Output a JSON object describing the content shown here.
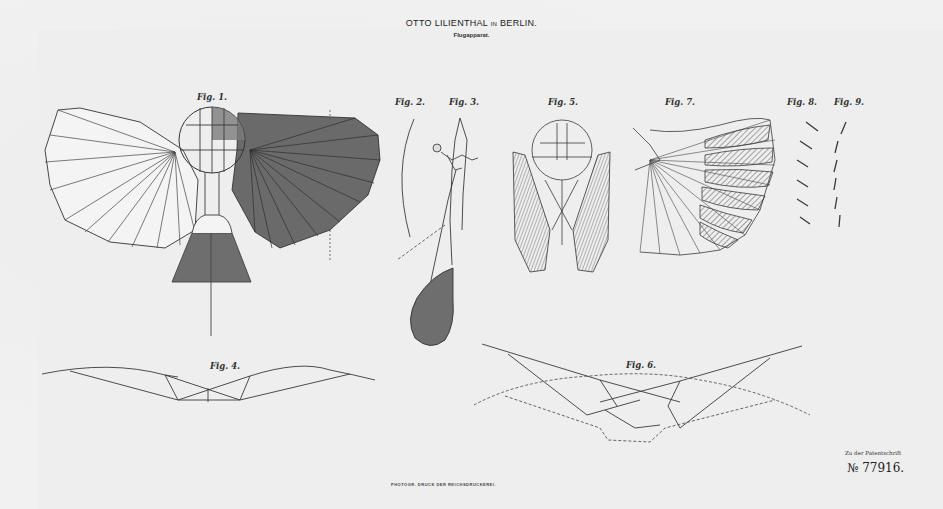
{
  "document": {
    "title_main": "OTTO LILIENTHAL",
    "title_in": "IN",
    "title_city": "BERLIN.",
    "subtitle": "Flugapparat.",
    "footer_note": "Zu der Patentschrift",
    "patent_number": "№ 77916.",
    "printer_line": "PHOTOGR. DRUCK DER REICHSDRUCKEREI."
  },
  "figures": [
    {
      "id": "fig1",
      "label": "Fig. 1.",
      "description": "Top view of glider with fan-ribbed wings, one wing shaded, tail surface below"
    },
    {
      "id": "fig2",
      "label": "Fig. 2.",
      "description": "Curved rib profile"
    },
    {
      "id": "fig3",
      "label": "Fig. 3.",
      "description": "Side view with pilot and teardrop tail"
    },
    {
      "id": "fig4",
      "label": "Fig. 4.",
      "description": "Front view of wing curvature"
    },
    {
      "id": "fig5",
      "label": "Fig. 5.",
      "description": "Folded wings view"
    },
    {
      "id": "fig6",
      "label": "Fig. 6.",
      "description": "Front view with wing positions (solid and dashed)"
    },
    {
      "id": "fig7",
      "label": "Fig. 7.",
      "description": "Wing with hatched flap sections"
    },
    {
      "id": "fig8",
      "label": "Fig. 8.",
      "description": "Slat profile series"
    },
    {
      "id": "fig9",
      "label": "Fig. 9.",
      "description": "Slat profile series (closed)"
    }
  ],
  "colors": {
    "paper": "#f1f1f1",
    "ink": "#3a3a3a",
    "shade": "#6e6e6e"
  }
}
